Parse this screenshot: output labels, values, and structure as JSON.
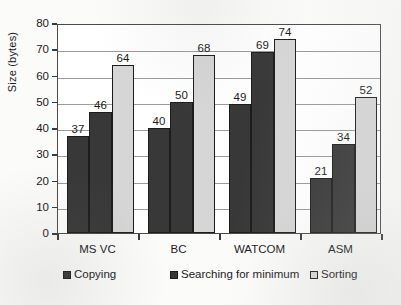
{
  "chart_data": {
    "type": "bar",
    "title": "",
    "xlabel": "",
    "ylabel": "Size (bytes)",
    "categories": [
      "MS VC",
      "BC",
      "WATCOM",
      "ASM"
    ],
    "series": [
      {
        "name": "Copying",
        "values": [
          37,
          40,
          49,
          21
        ],
        "color": "#383838"
      },
      {
        "name": "Searching for minimum",
        "values": [
          46,
          50,
          69,
          34
        ],
        "color": "#383838"
      },
      {
        "name": "Sorting",
        "values": [
          64,
          68,
          74,
          52
        ],
        "color": "#d6d6d6"
      }
    ],
    "ylim": [
      0,
      80
    ],
    "ytick_step": 10,
    "yticks": [
      0,
      10,
      20,
      30,
      40,
      50,
      60,
      70,
      80
    ],
    "ytick_labels": [
      "0",
      "10",
      "20",
      "30",
      "40",
      "50",
      "60",
      "70",
      "80"
    ],
    "grid": true,
    "grid_axis": "y",
    "legend_position": "bottom",
    "data_labels": true
  }
}
